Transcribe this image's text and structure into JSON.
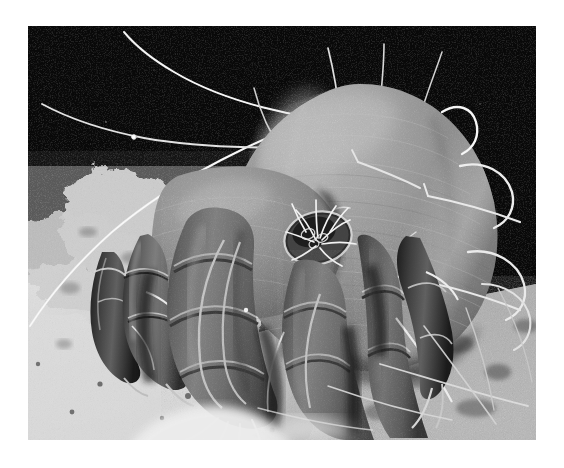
{
  "page": {
    "background_color": "#ffffff",
    "width": 564,
    "height": 468
  },
  "photo": {
    "name": "sem-micrograph-dust-mite",
    "alt_text": "Scanning electron micrograph of a house dust mite",
    "subject": "house dust mite",
    "technique": "scanning electron microscopy",
    "palette": {
      "background_black": "#050505",
      "body_midtone": "#8b8b8b",
      "body_highlight": "#d9d9d9",
      "body_shadow": "#3a3a3a",
      "leg_dark": "#4a4a4a",
      "substrate_light": "#e8e8e8",
      "substrate_mid": "#a8a8a8",
      "seta_white": "#f2f2f2",
      "border_white": "#ffffff"
    },
    "frame": {
      "left": 28,
      "top": 26,
      "width": 508,
      "height": 414
    },
    "features": [
      "globular opisthosoma (idiosoma) upper right",
      "long curved dorsal setae sweeping to upper left",
      "short hooked lateral setae on right flank",
      "four segmented anterior legs with claws",
      "gnathosoma with radiating palpal bristles",
      "granular detritus substrate at lower left",
      "fine crossing fibres over substrate at lower right"
    ]
  }
}
